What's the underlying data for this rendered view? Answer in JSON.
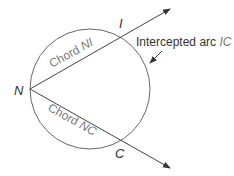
{
  "diagram": {
    "points": {
      "N": {
        "label": "N"
      },
      "I": {
        "label": "I"
      },
      "C": {
        "label": "C"
      }
    },
    "chords": {
      "NI": {
        "prefix": "Chord ",
        "name": "NI"
      },
      "NC": {
        "prefix": "Chord ",
        "name": "NC"
      }
    },
    "arc": {
      "prefix": "Intercepted arc ",
      "name": "IC"
    },
    "colors": {
      "line": "#555555",
      "label": "#333333",
      "chord_label": "#777777"
    }
  }
}
